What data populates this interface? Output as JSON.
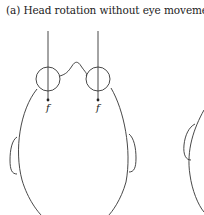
{
  "title": "(a)  Head rotation without eye movement",
  "labels": {
    "left_eye": "f",
    "right_eye": "f"
  },
  "colors": {
    "stroke": "#333333",
    "background": "#ffffff"
  }
}
